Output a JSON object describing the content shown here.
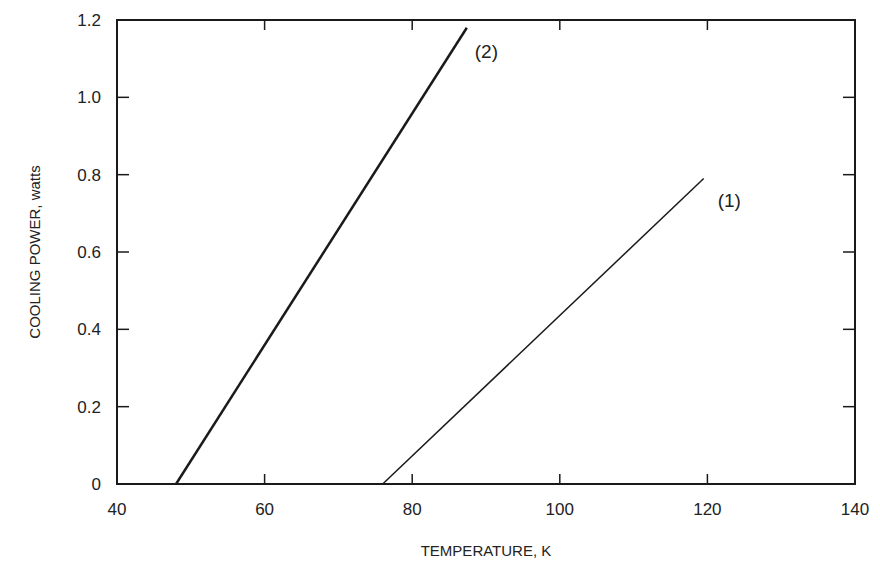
{
  "chart_data": {
    "type": "line",
    "title": "",
    "xlabel": "TEMPERATURE, K",
    "ylabel": "COOLING POWER, watts",
    "xlim": [
      40,
      140
    ],
    "ylim": [
      0,
      1.2
    ],
    "x_ticks": [
      40,
      60,
      80,
      100,
      120,
      140
    ],
    "x_tick_labels": [
      "40",
      "60",
      "80",
      "100",
      "120",
      "140"
    ],
    "y_ticks": [
      0,
      0.2,
      0.4,
      0.6,
      0.8,
      1.0,
      1.2
    ],
    "y_tick_labels": [
      "0",
      "0.2",
      "0.4",
      "0.6",
      "0.8",
      "1.0",
      "1.2"
    ],
    "grid": false,
    "legend": "inline labels at line ends",
    "series": [
      {
        "name": "(1)",
        "x": [
          76,
          119.5
        ],
        "y": [
          0,
          0.79
        ],
        "line_width": 1.5
      },
      {
        "name": "(2)",
        "x": [
          48,
          87.4
        ],
        "y": [
          0,
          1.18
        ],
        "line_width": 2.5
      }
    ]
  },
  "colors": {
    "line": "#1a1a1a",
    "axis": "#1a1a1a",
    "background": "#ffffff"
  }
}
